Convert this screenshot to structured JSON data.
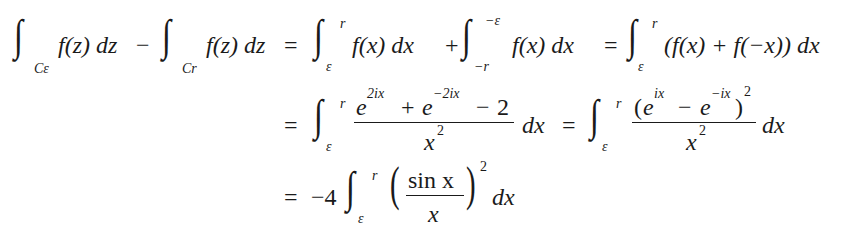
{
  "equation": {
    "line1": {
      "lhs_int1_sub": "Cε",
      "lhs_int1_body": "f(z) dz",
      "minus": "−",
      "lhs_int2_sub": "Cr",
      "lhs_int2_body": "f(z) dz",
      "eq": "=",
      "int3_upper": "r",
      "int3_lower": "ε",
      "int3_body": "f(x) dx",
      "plus": "+",
      "int4_upper": "−ε",
      "int4_lower": "−r",
      "int4_body": "f(x) dx",
      "eq2": "=",
      "int5_upper": "r",
      "int5_lower": "ε",
      "int5_body": "(f(x) + f(−x)) dx"
    },
    "line2": {
      "eq": "=",
      "int1_upper": "r",
      "int1_lower": "ε",
      "frac1_num": "e^{2ix} + e^{−2ix} − 2",
      "frac1_den": "x²",
      "dx1": "dx",
      "eq2": "=",
      "int2_upper": "r",
      "int2_lower": "ε",
      "frac2_num": "(e^{ix} − e^{−ix})²",
      "frac2_den": "x²",
      "dx2": "dx"
    },
    "line3": {
      "eq": "=",
      "coef": "−4",
      "int_upper": "r",
      "int_lower": "ε",
      "frac_num": "sin x",
      "frac_den": "x",
      "exp": "2",
      "dx": "dx"
    }
  },
  "glyphs": {
    "integral": "∫",
    "lparen": "(",
    "rparen": ")",
    "e": "e",
    "two_ix": "2ix",
    "minus_two_ix": "−2ix",
    "ix": "ix",
    "minus_ix": "−ix",
    "plus": "+",
    "minus": "−",
    "two": "2",
    "x": "x",
    "sq": "2"
  }
}
